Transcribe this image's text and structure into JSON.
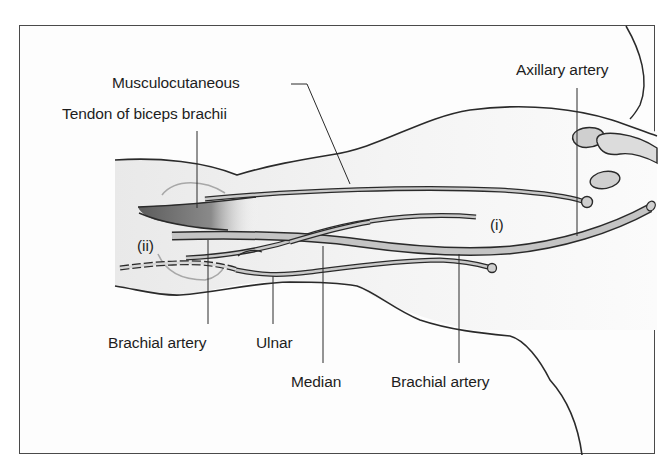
{
  "diagram": {
    "labels": {
      "musculocutaneous": "Musculocutaneous",
      "tendon_biceps": "Tendon of biceps brachii",
      "axillary_artery": "Axillary artery",
      "brachial_artery_left": "Brachial artery",
      "ulnar": "Ulnar",
      "median": "Median",
      "brachial_artery_right": "Brachial artery",
      "marker_i": "(i)",
      "marker_ii": "(ii)"
    },
    "colors": {
      "outline": "#2a2a2a",
      "vessel_fill": "#c8c8c8",
      "tendon_dark": "#6e6e6e",
      "arm_shade": "#ededed",
      "marker_ring": "#a8a8a8"
    }
  }
}
